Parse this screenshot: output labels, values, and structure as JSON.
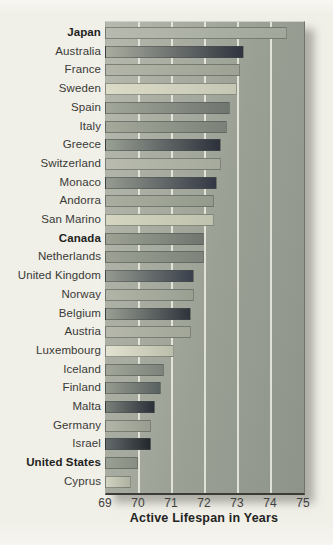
{
  "colors": {
    "paper": "#f0efe8",
    "panel_left": "#b6b9ad",
    "panel_right": "#8f948b",
    "panel_border": "#70756c",
    "gridline": "#f2f2e8",
    "bar_outline": "rgba(70,75,72,0.5)",
    "label_text": "#3a3a36",
    "tick_text": "#3f3f3c",
    "title_text": "#242422",
    "shadow": "rgba(110,110,104,0.5)"
  },
  "chart_data": {
    "type": "bar",
    "orientation": "horizontal",
    "title": "",
    "xlabel": "Active Lifespan in Years",
    "ylabel": "",
    "xlim": [
      69,
      75
    ],
    "xticks": [
      69,
      70,
      71,
      72,
      73,
      74,
      75
    ],
    "grid": "vertical-white-lines",
    "legend": "none",
    "categories": [
      "Japan",
      "Australia",
      "France",
      "Sweden",
      "Spain",
      "Italy",
      "Greece",
      "Switzerland",
      "Monaco",
      "Andorra",
      "San Marino",
      "Canada",
      "Netherlands",
      "United Kingdom",
      "Norway",
      "Belgium",
      "Austria",
      "Luxembourg",
      "Iceland",
      "Finland",
      "Malta",
      "Germany",
      "Israel",
      "United States",
      "Cyprus"
    ],
    "values": [
      74.5,
      73.2,
      73.1,
      73.0,
      72.8,
      72.7,
      72.5,
      72.5,
      72.4,
      72.3,
      72.3,
      72.0,
      72.0,
      71.7,
      71.7,
      71.6,
      71.6,
      71.1,
      70.8,
      70.7,
      70.5,
      70.4,
      70.4,
      70.0,
      69.8
    ],
    "bold_categories": [
      "Japan",
      "Canada",
      "United States"
    ],
    "bar_gradients": [
      {
        "from": "#b7bbaf",
        "to": "#a2a79b"
      },
      {
        "from": "#a9ad9f",
        "to": "#2e333e"
      },
      {
        "from": "#b3b6a9",
        "to": "#9da295"
      },
      {
        "from": "#dcdbc8",
        "to": "#c5c7b4"
      },
      {
        "from": "#a2a79a",
        "to": "#6f756f"
      },
      {
        "from": "#a4a99b",
        "to": "#7b8178"
      },
      {
        "from": "#99a093",
        "to": "#2b303b"
      },
      {
        "from": "#b8bbae",
        "to": "#a5aa9d"
      },
      {
        "from": "#969c90",
        "to": "#333845"
      },
      {
        "from": "#a9aea0",
        "to": "#949a8c"
      },
      {
        "from": "#d5d5c1",
        "to": "#bfc2ae"
      },
      {
        "from": "#9da294",
        "to": "#70766f"
      },
      {
        "from": "#9ca194",
        "to": "#7d837a"
      },
      {
        "from": "#959b8f",
        "to": "#3a404c"
      },
      {
        "from": "#b1b4a7",
        "to": "#99a092"
      },
      {
        "from": "#9aa093",
        "to": "#2e333c"
      },
      {
        "from": "#b5b8ab",
        "to": "#a1a699"
      },
      {
        "from": "#e3e2d1",
        "to": "#bcbfab"
      },
      {
        "from": "#a1a699",
        "to": "#7d837a"
      },
      {
        "from": "#969b8f",
        "to": "#596061"
      },
      {
        "from": "#7a8079",
        "to": "#2a2f39"
      },
      {
        "from": "#b2b5a8",
        "to": "#989d90"
      },
      {
        "from": "#646a6c",
        "to": "#22272d"
      },
      {
        "from": "#9aa093",
        "to": "#888d83"
      },
      {
        "from": "#d2d3c0",
        "to": "#aeb2a1"
      }
    ]
  }
}
